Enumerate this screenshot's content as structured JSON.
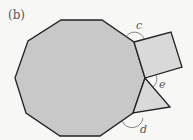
{
  "figure": {
    "label": "(b)",
    "shapes": {
      "decagon": {
        "points": "61,20 102,20 134,42 145,78 133,113 100,136 60,136 26,113 15,78 28,41",
        "fill": "#c8c8c8"
      },
      "square": {
        "points": "134,42 171,32 182,67 145,78",
        "fill": "#d9d9d9"
      },
      "triangle": {
        "points": "145,78 170,107 133,113",
        "fill": "#d9d9d9"
      }
    },
    "angles": [
      {
        "name": "c",
        "label": "c"
      },
      {
        "name": "e",
        "label": "e"
      },
      {
        "name": "d",
        "label": "d"
      }
    ],
    "stroke_color": "#222222",
    "arc_color": "#777777"
  }
}
